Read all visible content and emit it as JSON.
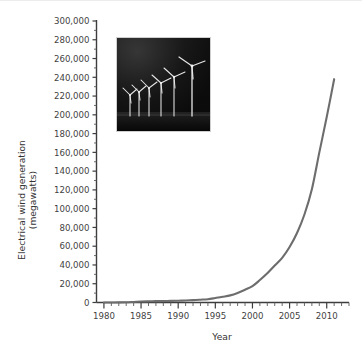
{
  "figure": {
    "background_color": "#ffffff",
    "curve_color": "#6d6d6d",
    "axis_color": "#3d3d3d"
  },
  "axes": {
    "y_title_line1": "Electrical wind generation",
    "y_title_line2": "(megawatts)",
    "x_title": "Year",
    "y_ticks": [
      "0",
      "20,000",
      "40,000",
      "60,000",
      "80,000",
      "100,000",
      "120,000",
      "140,000",
      "160,000",
      "180,000",
      "200,000",
      "220,000",
      "240,000",
      "260,000",
      "280,000",
      "300,000"
    ],
    "x_ticks": [
      "1980",
      "1985",
      "1990",
      "1995",
      "2000",
      "2005",
      "2010"
    ]
  },
  "inset": {
    "name": "wind-turbine-photograph",
    "description": "Night photograph of a row of white wind turbines increasing in height from left to right against a dark sky",
    "turbine_count": 7,
    "background_color": "#0d0d0d"
  },
  "chart_data": {
    "type": "line",
    "title": "",
    "xlabel": "Year",
    "ylabel": "Electrical wind generation (megawatts)",
    "xlim": [
      1979,
      2013
    ],
    "ylim": [
      0,
      300000
    ],
    "grid": false,
    "legend": "none",
    "x_tick_step_major": 5,
    "x_tick_step_minor": 1,
    "y_tick_step": 20000,
    "series": [
      {
        "name": "Electrical wind generation",
        "color": "#6d6d6d",
        "x": [
          1980,
          1981,
          1982,
          1983,
          1984,
          1985,
          1986,
          1987,
          1988,
          1989,
          1990,
          1991,
          1992,
          1993,
          1994,
          1995,
          1996,
          1997,
          1998,
          1999,
          2000,
          2001,
          2002,
          2003,
          2004,
          2005,
          2006,
          2007,
          2008,
          2009,
          2010,
          2011
        ],
        "values": [
          10,
          25,
          90,
          210,
          600,
          1020,
          1270,
          1450,
          1580,
          1730,
          1930,
          2170,
          2510,
          2990,
          3530,
          4780,
          6100,
          7600,
          10200,
          13600,
          17400,
          23900,
          31100,
          39431,
          47620,
          59091,
          74052,
          93820,
          120690,
          159766,
          197637,
          238000
        ],
        "endpoint_value": 238000,
        "endpoint_year": 2011
      }
    ]
  }
}
